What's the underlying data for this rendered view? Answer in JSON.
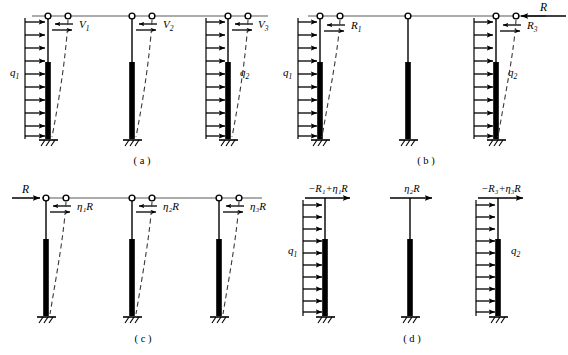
{
  "figure": {
    "title": "",
    "colors": {
      "ink": "#000000",
      "beam": "#8f8f8f",
      "column_solid": "#000000",
      "dashed": "#555555",
      "background": "#ffffff"
    },
    "panels": [
      {
        "id": "a",
        "caption": "( a )",
        "columns": [
          {
            "name": "column-1",
            "top_hinges": 2,
            "has_distributed_load": true,
            "load_label": "q",
            "load_sub": "1",
            "load_side": "left",
            "load_arrow_dir": "right",
            "shear_label": "V",
            "shear_sub": "1",
            "shear_arrows": "couple",
            "deflection_dashed": true,
            "base": "fixed-hatched"
          },
          {
            "name": "column-2",
            "top_hinges": 2,
            "has_distributed_load": false,
            "load_label": "",
            "load_sub": "",
            "load_side": "none",
            "load_arrow_dir": "",
            "shear_label": "V",
            "shear_sub": "2",
            "shear_arrows": "couple",
            "deflection_dashed": true,
            "base": "fixed-hatched"
          },
          {
            "name": "column-3",
            "top_hinges": 2,
            "has_distributed_load": true,
            "load_label": "q",
            "load_sub": "2",
            "load_side": "left",
            "load_arrow_dir": "right",
            "shear_label": "V",
            "shear_sub": "3",
            "shear_arrows": "couple",
            "deflection_dashed": true,
            "base": "fixed-hatched"
          }
        ],
        "applied_force": null
      },
      {
        "id": "b",
        "caption": "( b )",
        "columns": [
          {
            "name": "column-1",
            "top_hinges": 2,
            "has_distributed_load": true,
            "load_label": "q",
            "load_sub": "1",
            "load_side": "left",
            "load_arrow_dir": "right",
            "shear_label": "R",
            "shear_sub": "1",
            "shear_arrows": "couple",
            "deflection_dashed": true,
            "base": "fixed-hatched"
          },
          {
            "name": "column-2",
            "top_hinges": 1,
            "has_distributed_load": false,
            "load_label": "",
            "load_sub": "",
            "load_side": "none",
            "load_arrow_dir": "",
            "shear_label": "",
            "shear_sub": "",
            "shear_arrows": "none",
            "deflection_dashed": false,
            "base": "fixed-hatched"
          },
          {
            "name": "column-3",
            "top_hinges": 2,
            "has_distributed_load": true,
            "load_label": "q",
            "load_sub": "2",
            "load_side": "left",
            "load_arrow_dir": "right",
            "shear_label": "R",
            "shear_sub": "3",
            "shear_arrows": "couple",
            "deflection_dashed": true,
            "base": "fixed-hatched"
          }
        ],
        "applied_force": {
          "label": "R",
          "side": "right",
          "direction": "left"
        }
      },
      {
        "id": "c",
        "caption": "( c )",
        "columns": [
          {
            "name": "column-1",
            "top_hinges": 2,
            "has_distributed_load": false,
            "load_label": "",
            "load_sub": "",
            "load_side": "none",
            "load_arrow_dir": "",
            "shear_label": "η₁R",
            "shear_sub": "",
            "shear_arrows": "couple",
            "deflection_dashed": true,
            "base": "fixed-hatched"
          },
          {
            "name": "column-2",
            "top_hinges": 2,
            "has_distributed_load": false,
            "load_label": "",
            "load_sub": "",
            "load_side": "none",
            "load_arrow_dir": "",
            "shear_label": "η₂R",
            "shear_sub": "",
            "shear_arrows": "couple",
            "deflection_dashed": true,
            "base": "fixed-hatched"
          },
          {
            "name": "column-3",
            "top_hinges": 2,
            "has_distributed_load": false,
            "load_label": "",
            "load_sub": "",
            "load_side": "none",
            "load_arrow_dir": "",
            "shear_label": "η₃R",
            "shear_sub": "",
            "shear_arrows": "couple",
            "deflection_dashed": true,
            "base": "fixed-hatched"
          }
        ],
        "applied_force": {
          "label": "R",
          "side": "left",
          "direction": "right"
        }
      },
      {
        "id": "d",
        "caption": "( d )",
        "columns": [
          {
            "name": "column-1",
            "top_hinges": 0,
            "has_distributed_load": true,
            "load_label": "q",
            "load_sub": "1",
            "load_side": "left",
            "load_arrow_dir": "right",
            "shear_label": "",
            "shear_sub": "",
            "shear_arrows": "none",
            "deflection_dashed": false,
            "base": "fixed-hatched",
            "top_force_label": "−R₁+η₁R"
          },
          {
            "name": "column-2",
            "top_hinges": 0,
            "has_distributed_load": false,
            "load_label": "",
            "load_sub": "",
            "load_side": "none",
            "load_arrow_dir": "",
            "shear_label": "",
            "shear_sub": "",
            "shear_arrows": "none",
            "deflection_dashed": false,
            "base": "fixed-hatched",
            "top_force_label": "η₂R"
          },
          {
            "name": "column-3",
            "top_hinges": 0,
            "has_distributed_load": true,
            "load_label": "q",
            "load_sub": "2",
            "load_side": "left",
            "load_arrow_dir": "right",
            "shear_label": "",
            "shear_sub": "",
            "shear_arrows": "none",
            "deflection_dashed": false,
            "base": "fixed-hatched",
            "top_force_label": "−R₃+η₃R"
          }
        ],
        "applied_force": null
      }
    ],
    "labels": {
      "a_caption": "( a )",
      "b_caption": "( b )",
      "c_caption": "( c )",
      "d_caption": "( d )",
      "q1": "q",
      "q1_sub": "1",
      "q2": "q",
      "q2_sub": "2",
      "V1": "V",
      "V1_sub": "1",
      "V2": "V",
      "V2_sub": "2",
      "V3": "V",
      "V3_sub": "3",
      "R": "R",
      "R1": "R",
      "R1_sub": "1",
      "R3": "R",
      "R3_sub": "3",
      "eta1R": "η₁R",
      "eta2R": "η₂R",
      "eta3R": "η₃R",
      "d_force_1": "−R₁+η₁R",
      "d_force_2": "η₂R",
      "d_force_3": "−R₃+η₃R"
    }
  }
}
